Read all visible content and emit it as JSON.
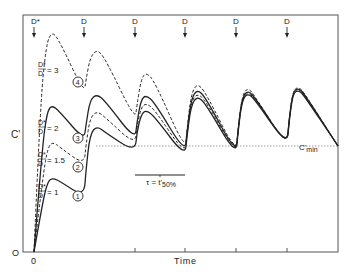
{
  "chart_data": {
    "type": "line",
    "title": "",
    "xlabel": "Time",
    "ylabel": "C'",
    "x_origin_label": "0",
    "y_origin_label": "O",
    "grid": false,
    "reference_line": {
      "label": "C'min",
      "style": "dotted",
      "y_px": 146
    },
    "dose_markers": [
      {
        "label": "D*",
        "x_px": 34
      },
      {
        "label": "D",
        "x_px": 84
      },
      {
        "label": "D",
        "x_px": 135
      },
      {
        "label": "D",
        "x_px": 185
      },
      {
        "label": "D",
        "x_px": 236
      },
      {
        "label": "D",
        "x_px": 287
      }
    ],
    "interval_annotation": {
      "label": "τ = t'50%",
      "x_start_px": 135,
      "x_end_px": 185,
      "y_px": 175
    },
    "series": [
      {
        "name": "D*/D = 3",
        "marker": "4",
        "style": "dashed",
        "points": [
          [
            34,
            252
          ],
          [
            40,
            110
          ],
          [
            46,
            45
          ],
          [
            52,
            31
          ],
          [
            60,
            42
          ],
          [
            84,
            93
          ],
          [
            86,
            80
          ],
          [
            90,
            58
          ],
          [
            97,
            49
          ],
          [
            106,
            60
          ],
          [
            135,
            120
          ],
          [
            137,
            105
          ],
          [
            141,
            80
          ],
          [
            146,
            72
          ],
          [
            155,
            82
          ],
          [
            185,
            150
          ],
          [
            187,
            130
          ],
          [
            191,
            95
          ],
          [
            197,
            83
          ],
          [
            206,
            93
          ],
          [
            236,
            153
          ],
          [
            238,
            130
          ],
          [
            242,
            96
          ],
          [
            248,
            87
          ],
          [
            256,
            98
          ],
          [
            287,
            146
          ],
          [
            289,
            120
          ],
          [
            293,
            90
          ],
          [
            299,
            87
          ],
          [
            305,
            94
          ],
          [
            338,
            146
          ]
        ]
      },
      {
        "name": "D*/D = 2",
        "marker": "3",
        "style": "solid",
        "points": [
          [
            34,
            252
          ],
          [
            42,
            150
          ],
          [
            47,
            112
          ],
          [
            52,
            105
          ],
          [
            60,
            112
          ],
          [
            84,
            140
          ],
          [
            86,
            125
          ],
          [
            90,
            100
          ],
          [
            97,
            94
          ],
          [
            106,
            102
          ],
          [
            135,
            140
          ],
          [
            137,
            122
          ],
          [
            141,
            100
          ],
          [
            146,
            95
          ],
          [
            155,
            103
          ],
          [
            185,
            153
          ],
          [
            187,
            132
          ],
          [
            191,
            100
          ],
          [
            197,
            89
          ],
          [
            206,
            98
          ],
          [
            236,
            154
          ],
          [
            238,
            130
          ],
          [
            242,
            98
          ],
          [
            248,
            90
          ],
          [
            256,
            99
          ],
          [
            287,
            146
          ],
          [
            289,
            120
          ],
          [
            293,
            91
          ],
          [
            299,
            88
          ],
          [
            305,
            95
          ],
          [
            338,
            146
          ]
        ]
      },
      {
        "name": "D*/D = 1.5",
        "marker": "2",
        "style": "dashed",
        "points": [
          [
            34,
            252
          ],
          [
            43,
            175
          ],
          [
            48,
            147
          ],
          [
            53,
            142
          ],
          [
            61,
            148
          ],
          [
            84,
            165
          ],
          [
            86,
            145
          ],
          [
            90,
            118
          ],
          [
            97,
            111
          ],
          [
            106,
            118
          ],
          [
            135,
            145
          ],
          [
            137,
            126
          ],
          [
            141,
            108
          ],
          [
            146,
            103
          ],
          [
            155,
            110
          ],
          [
            185,
            155
          ],
          [
            187,
            134
          ],
          [
            191,
            103
          ],
          [
            197,
            93
          ],
          [
            206,
            101
          ],
          [
            236,
            155
          ],
          [
            238,
            131
          ],
          [
            242,
            99
          ],
          [
            248,
            92
          ],
          [
            256,
            100
          ],
          [
            287,
            146
          ],
          [
            289,
            121
          ],
          [
            293,
            92
          ],
          [
            299,
            89
          ],
          [
            305,
            96
          ],
          [
            338,
            146
          ]
        ]
      },
      {
        "name": "D*/D = 1",
        "marker": "1",
        "style": "solid",
        "points": [
          [
            34,
            252
          ],
          [
            43,
            200
          ],
          [
            48,
            181
          ],
          [
            53,
            178
          ],
          [
            61,
            182
          ],
          [
            84,
            197
          ],
          [
            86,
            170
          ],
          [
            90,
            134
          ],
          [
            97,
            126
          ],
          [
            106,
            133
          ],
          [
            135,
            152
          ],
          [
            137,
            132
          ],
          [
            141,
            115
          ],
          [
            146,
            110
          ],
          [
            155,
            117
          ],
          [
            185,
            157
          ],
          [
            187,
            136
          ],
          [
            191,
            106
          ],
          [
            197,
            96
          ],
          [
            206,
            104
          ],
          [
            236,
            156
          ],
          [
            238,
            132
          ],
          [
            242,
            100
          ],
          [
            248,
            93
          ],
          [
            256,
            101
          ],
          [
            287,
            146
          ],
          [
            289,
            122
          ],
          [
            293,
            93
          ],
          [
            299,
            90
          ],
          [
            305,
            97
          ],
          [
            338,
            146
          ]
        ]
      }
    ],
    "series_labels": [
      {
        "num": "D*",
        "den": "D",
        "value": "= 3",
        "marker": "4",
        "x_px": 38,
        "y_px": 70,
        "marker_x": 78,
        "marker_y": 82
      },
      {
        "num": "D*",
        "den": "D",
        "value": "= 2",
        "marker": "3",
        "x_px": 38,
        "y_px": 128,
        "marker_x": 78,
        "marker_y": 138
      },
      {
        "num": "D*",
        "den": "D",
        "value": "= 1.5",
        "marker": "2",
        "x_px": 38,
        "y_px": 160,
        "marker_x": 78,
        "marker_y": 167
      },
      {
        "num": "D*",
        "den": "D",
        "value": "= 1",
        "marker": "1",
        "x_px": 38,
        "y_px": 192,
        "marker_x": 78,
        "marker_y": 196
      }
    ],
    "axes": {
      "frame": {
        "left": 23,
        "top": 15,
        "right": 338,
        "bottom": 252
      },
      "x_ticks_px": [
        135,
        185,
        236,
        287
      ]
    }
  },
  "labels": {
    "ylabel": "C'",
    "xlabel": "Time",
    "x_zero": "0",
    "y_zero": "O",
    "cmin_main": "C'",
    "cmin_sub": "min",
    "tau_main": "τ = t'",
    "tau_sub": "50%"
  },
  "colors": {
    "ink": "#222222",
    "background": "#ffffff",
    "dotted": "#888888"
  }
}
